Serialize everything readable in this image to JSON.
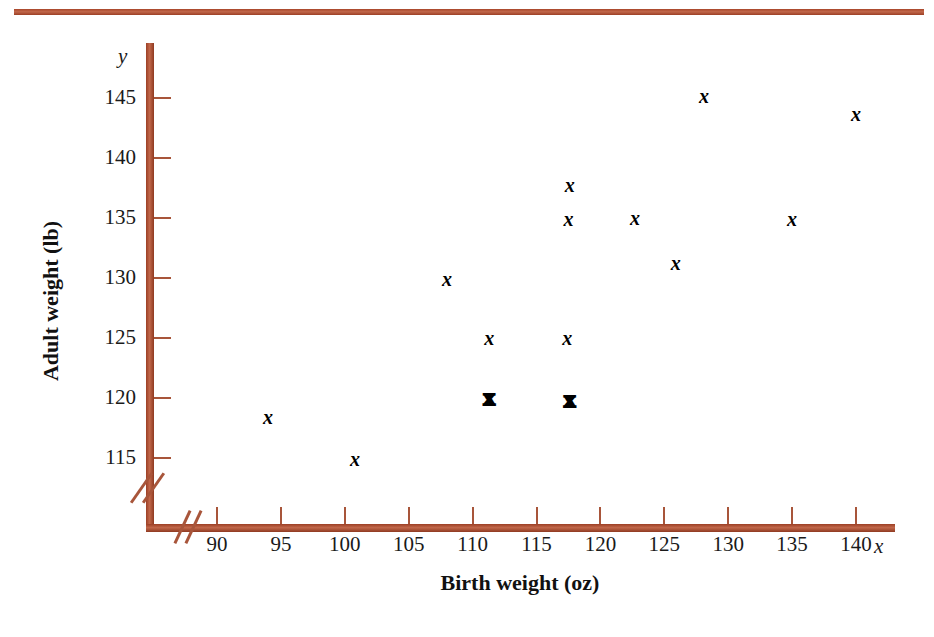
{
  "figure": {
    "kind": "scatterplot",
    "marker_glyph": "x",
    "accent_color": "#a8462a",
    "marker_color": "#000000"
  },
  "axis_letters": {
    "y": "y",
    "x": "x"
  },
  "chart_data": {
    "type": "scatter",
    "title": "",
    "xlabel": "Birth weight (oz)",
    "ylabel": "Adult weight (lb)",
    "xlim": [
      86,
      143
    ],
    "ylim": [
      112,
      148
    ],
    "grid": false,
    "legend": null,
    "axis_break_x": true,
    "axis_break_y": true,
    "xticks": [
      90,
      95,
      100,
      105,
      110,
      115,
      120,
      125,
      130,
      135,
      140
    ],
    "yticks": [
      115,
      120,
      125,
      130,
      135,
      140,
      145
    ],
    "xticklabels": [
      "90",
      "95",
      "100",
      "105",
      "110",
      "115",
      "120",
      "125",
      "130",
      "135",
      "140"
    ],
    "yticklabels": [
      "115",
      "120",
      "125",
      "130",
      "135",
      "140",
      "145"
    ],
    "points": [
      {
        "x": 94.0,
        "y": 118.3,
        "emphasis": false
      },
      {
        "x": 100.8,
        "y": 114.8,
        "emphasis": false
      },
      {
        "x": 108.0,
        "y": 129.8,
        "emphasis": false
      },
      {
        "x": 111.3,
        "y": 124.9,
        "emphasis": false
      },
      {
        "x": 111.3,
        "y": 120.1,
        "emphasis": true
      },
      {
        "x": 117.6,
        "y": 137.7,
        "emphasis": false
      },
      {
        "x": 117.5,
        "y": 134.8,
        "emphasis": false
      },
      {
        "x": 117.4,
        "y": 124.9,
        "emphasis": false
      },
      {
        "x": 117.6,
        "y": 119.9,
        "emphasis": true
      },
      {
        "x": 122.7,
        "y": 134.9,
        "emphasis": false
      },
      {
        "x": 125.9,
        "y": 131.2,
        "emphasis": false
      },
      {
        "x": 128.1,
        "y": 145.1,
        "emphasis": false
      },
      {
        "x": 135.0,
        "y": 134.8,
        "emphasis": false
      },
      {
        "x": 140.0,
        "y": 143.6,
        "emphasis": false
      }
    ]
  }
}
